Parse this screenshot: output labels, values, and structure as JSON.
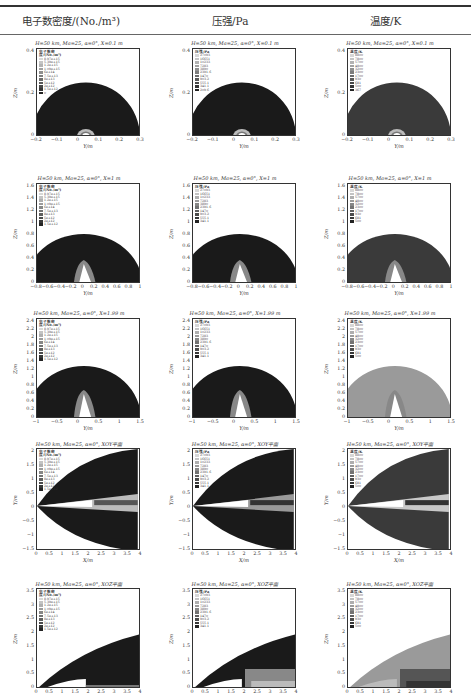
{
  "header": {
    "col1": "电子数密度/(No./m³)",
    "col2": "压强/Pa",
    "col3": "温度/K"
  },
  "rows": [
    {
      "title": "H=50 km, Ma=25, α=0°, X=0.1 m",
      "xlabel": "Y/m",
      "ylabel": "Z/m",
      "xticks": [
        "−0.2",
        "−0.1",
        "0",
        "0.1",
        "0.2",
        "0.3"
      ],
      "yticks": [
        "0.4",
        "0.2",
        "0"
      ]
    },
    {
      "title": "H=50 km, Ma=25, α=0°, X=1 m",
      "xlabel": "Y/m",
      "ylabel": "Z/m",
      "xticks": [
        "−0.8",
        "−0.6",
        "−0.4",
        "−0.2",
        "0",
        "0.2",
        "0.4",
        "0.6",
        "0.8",
        "1"
      ],
      "yticks": [
        "1.6",
        "1.4",
        "1.2",
        "1",
        "0.8",
        "0.6",
        "0.4",
        "0.2",
        "0"
      ]
    },
    {
      "title": "H=50 km, Ma=25, α=0°, X=1.99 m",
      "xlabel": "Y/m",
      "ylabel": "Z/m",
      "xticks": [
        "−1",
        "−0.5",
        "0",
        "0.5",
        "1",
        "1.5"
      ],
      "yticks": [
        "2.4",
        "2.2",
        "2",
        "1.8",
        "1.6",
        "1.4",
        "1.2",
        "1",
        "0.8",
        "0.6",
        "0.4",
        "0.2",
        "0"
      ]
    },
    {
      "title": "H=50 km, Ma=25, α=0°, XOY平面",
      "xlabel": "X/m",
      "ylabel": "Y/m",
      "xticks": [
        "0",
        "0.5",
        "1",
        "1.5",
        "2",
        "2.5",
        "3",
        "3.5",
        "4"
      ],
      "yticks": [
        "2",
        "1.5",
        "1",
        "0.5",
        "0",
        "−0.5",
        "−1",
        "−1.5"
      ]
    },
    {
      "title": "H=50 km, Ma=25, α=0°, XOZ平面",
      "xlabel": "X/m",
      "ylabel": "Z/m",
      "xticks": [
        "0",
        "0.5",
        "1",
        "1.5",
        "2",
        "2.5",
        "3",
        "3.5",
        "4"
      ],
      "yticks": [
        "3.5",
        "3",
        "2.5",
        "2",
        "1.5",
        "1",
        "0.5",
        "0"
      ]
    }
  ],
  "legends": {
    "electron": {
      "title": "电子数密度/(No./m³)",
      "entries": [
        "8.97e+15",
        "5.39e+15",
        "1.2e+15",
        "1.09e+15",
        "6e+14",
        "7.5e+13",
        "8e+13",
        "5e+12",
        "2e+12",
        "1.5e+12",
        "0"
      ]
    },
    "pressure": {
      "title": "压强/Pa",
      "entries": [
        "27093",
        "16651",
        "10233",
        "7283",
        "3890",
        "2391.6",
        "1470",
        "903.2",
        "555.1",
        "341.1",
        "209.6",
        "128.8"
      ]
    },
    "temperature": {
      "title": "温度/K",
      "entries": [
        "8800",
        "7800",
        "5700",
        "4800",
        "3200",
        "2300",
        "1700",
        "930",
        "681",
        "500",
        "367",
        "261"
      ]
    }
  },
  "colors": {
    "electron_bg": "#1a1a1a",
    "pressure_bg": "#1c1c1c",
    "temperature_bg": "#3a3a3a",
    "temperature_bg_light": "#9a9a9a",
    "body_white": "#ffffff",
    "rule": "#333333"
  },
  "chart_data": [
    {
      "type": "heatmap",
      "title": "Contour grid: electron number density, pressure, temperature around hypersonic vehicle",
      "columns": [
        "电子数密度/(No./m³)",
        "压强/Pa",
        "温度/K"
      ],
      "row_conditions": [
        "X=0.1 m",
        "X=1 m",
        "X=1.99 m",
        "XOY平面",
        "XOZ平面"
      ],
      "flight_condition": {
        "H_km": 50,
        "Ma": 25,
        "alpha_deg": 0
      },
      "axis_ranges": {
        "X=0.1 m": {
          "x": [
            -0.3,
            0.3
          ],
          "y": [
            0,
            0.5
          ]
        },
        "X=1 m": {
          "x": [
            -0.9,
            1.0
          ],
          "y": [
            0,
            1.7
          ]
        },
        "X=1.99 m": {
          "x": [
            -1.3,
            1.5
          ],
          "y": [
            0,
            2.4
          ]
        },
        "XOY平面": {
          "x": [
            0,
            4
          ],
          "y": [
            -1.7,
            2.2
          ]
        },
        "XOZ平面": {
          "x": [
            0,
            4
          ],
          "y": [
            0,
            3.6
          ]
        }
      },
      "shock_standoff_height_m": {
        "X=0.1 m": 0.28,
        "X=1 m": 0.82,
        "X=1.99 m": 1.28,
        "XOZ_at_X4": 1.95
      },
      "grid": false,
      "legend_position": "upper-left inside each plot"
    }
  ]
}
